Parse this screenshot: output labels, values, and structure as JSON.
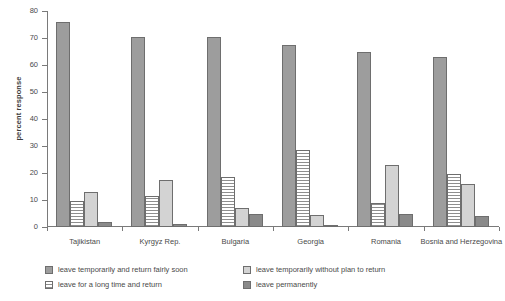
{
  "chart_data": {
    "type": "bar",
    "title": "",
    "xlabel": "",
    "ylabel": "percent response",
    "ylim": [
      0,
      80
    ],
    "yticks": [
      0,
      10,
      20,
      30,
      40,
      50,
      60,
      70,
      80
    ],
    "grid": false,
    "legend_position": "bottom",
    "categories": [
      "Tajikistan",
      "Kyrgyz Rep.",
      "Bulgaria",
      "Georgia",
      "Romania",
      "Bosnia and Herzegovina"
    ],
    "series": [
      {
        "name": "leave temporarily and return fairly soon",
        "swatch": "solid-mid-gray",
        "color": "#9d9d9d",
        "values": [
          76,
          70.5,
          70.5,
          67.5,
          65,
          63
        ]
      },
      {
        "name": "leave for a long time and return",
        "swatch": "horizontal-hatch",
        "color": "#ffffff",
        "values": [
          9.5,
          11.5,
          18.5,
          28.5,
          9,
          19.5
        ]
      },
      {
        "name": "leave temporarily without plan to return",
        "swatch": "solid-light-gray",
        "color": "#d3d3d3",
        "values": [
          13,
          17.3,
          7,
          4.5,
          23,
          16
        ]
      },
      {
        "name": "leave permanently",
        "swatch": "solid-dark-gray",
        "color": "#8a8a8a",
        "values": [
          2,
          1.3,
          5,
          0.3,
          5,
          4
        ]
      }
    ]
  },
  "legend": {
    "items": [
      "leave temporarily and return fairly soon",
      "leave temporarily without plan to return",
      "leave for a long time and return",
      "leave permanently"
    ]
  }
}
